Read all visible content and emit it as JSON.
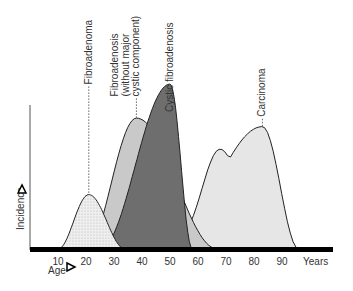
{
  "chart_data": {
    "type": "area",
    "title": "",
    "xlabel": "Age",
    "ylabel": "Incidence",
    "x_unit_label": "Years",
    "x_ticks": [
      10,
      20,
      30,
      40,
      50,
      60,
      70,
      80,
      90
    ],
    "xlim": [
      0,
      100
    ],
    "ylim": [
      0,
      1
    ],
    "y_ticks": [],
    "grid": false,
    "legend": "none",
    "series": [
      {
        "name": "Fibroadenoma",
        "label_lines": [
          "Fibroadenoma"
        ],
        "peak_age": 21,
        "onset_age": 10,
        "end_age": 34,
        "relative_peak": 0.32,
        "fill": "#ececec",
        "pattern": "dotted"
      },
      {
        "name": "Fibroadenosis (without major cystic component)",
        "label_lines": [
          "Fibroadenosis",
          "(without major",
          "cystic component)"
        ],
        "peak_age": 38,
        "onset_age": 20,
        "end_age": 67,
        "relative_peak": 0.77,
        "fill": "#c9c9c9",
        "pattern": "solid"
      },
      {
        "name": "Cystic fibroadenosis",
        "label_lines": [
          "Cystic fibroadenosis"
        ],
        "peak_age": 50,
        "onset_age": 25,
        "end_age": 58,
        "relative_peak": 0.97,
        "fill": "#6e6e6e",
        "pattern": "solid"
      },
      {
        "name": "Carcinoma",
        "label_lines": [
          "Carcinoma"
        ],
        "peak_age": 83,
        "secondary_peak_age": 67,
        "onset_age": 35,
        "end_age": 96,
        "relative_peak": 0.72,
        "fill": "#e6e6e6",
        "pattern": "solid"
      }
    ]
  }
}
